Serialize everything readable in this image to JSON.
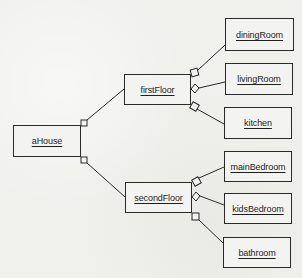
{
  "diagram": {
    "type": "UML object diagram (composition / aggregation)",
    "colors": {
      "background": "#f0f0ed",
      "line": "#2a2a2a",
      "text": "#1f1f1f"
    },
    "nodes": [
      {
        "id": "aHouse",
        "label": "aHouse",
        "x": 13,
        "y": 125,
        "w": 68,
        "h": 32
      },
      {
        "id": "firstFloor",
        "label": "firstFloor",
        "x": 124,
        "y": 74,
        "w": 67,
        "h": 31
      },
      {
        "id": "secondFloor",
        "label": "secondFloor",
        "x": 125,
        "y": 182,
        "w": 67,
        "h": 31
      },
      {
        "id": "diningRoom",
        "label": "diningRoom",
        "x": 225,
        "y": 18,
        "w": 69,
        "h": 33
      },
      {
        "id": "livingRoom",
        "label": "livingRoom",
        "x": 225,
        "y": 63,
        "w": 68,
        "h": 32
      },
      {
        "id": "kitchen",
        "label": "kitchen",
        "x": 224,
        "y": 107,
        "w": 68,
        "h": 32
      },
      {
        "id": "mainBedroom",
        "label": "mainBedroom",
        "x": 224,
        "y": 151,
        "w": 68,
        "h": 31
      },
      {
        "id": "kidsBedroom",
        "label": "kidsBedroom",
        "x": 224,
        "y": 193,
        "w": 68,
        "h": 31
      },
      {
        "id": "bathroom",
        "label": "bathroom",
        "x": 223,
        "y": 237,
        "w": 68,
        "h": 31
      }
    ],
    "links": [
      {
        "from": "aHouse",
        "to": "firstFloor",
        "end_marker": "square"
      },
      {
        "from": "aHouse",
        "to": "secondFloor",
        "end_marker": "square"
      },
      {
        "from": "firstFloor",
        "to": "diningRoom",
        "end_marker": "square"
      },
      {
        "from": "firstFloor",
        "to": "livingRoom",
        "end_marker": "diamond"
      },
      {
        "from": "firstFloor",
        "to": "kitchen",
        "end_marker": "square"
      },
      {
        "from": "secondFloor",
        "to": "mainBedroom",
        "end_marker": "square"
      },
      {
        "from": "secondFloor",
        "to": "kidsBedroom",
        "end_marker": "diamond"
      },
      {
        "from": "secondFloor",
        "to": "bathroom",
        "end_marker": "square"
      }
    ]
  }
}
